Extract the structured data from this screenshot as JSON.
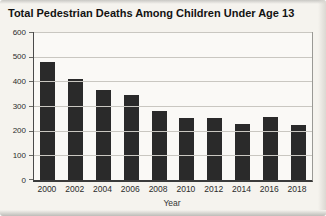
{
  "title": "Total Pedestrian Deaths Among Children Under Age 13",
  "chart_data": {
    "type": "bar",
    "title": "Total Pedestrian Deaths Among Children Under Age 13",
    "categories": [
      "2000",
      "2002",
      "2004",
      "2006",
      "2008",
      "2010",
      "2012",
      "2014",
      "2016",
      "2018"
    ],
    "values": [
      480,
      410,
      365,
      345,
      278,
      252,
      250,
      228,
      257,
      222
    ],
    "xlabel": "Year",
    "ylabel": "",
    "ylim": [
      0,
      600
    ],
    "yticks": [
      0,
      100,
      200,
      300,
      400,
      500,
      600
    ],
    "grid": true,
    "legend": "none",
    "bar_color": "#2a2a2a",
    "grid_color": "#c9c7c1",
    "background_color": "#f5f3ee"
  }
}
